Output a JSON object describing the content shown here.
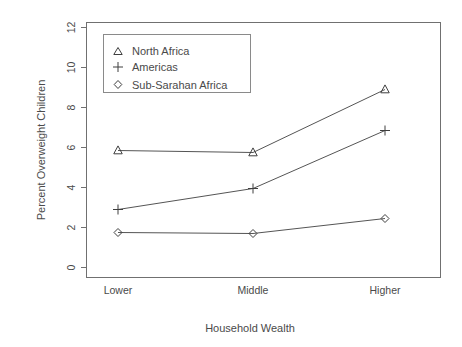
{
  "chart_data": {
    "type": "line",
    "title": "",
    "xlabel": "Household Wealth",
    "ylabel": "Percent Overweight Children",
    "categories": [
      "Lower",
      "Middle",
      "Higher"
    ],
    "series": [
      {
        "name": "North Africa",
        "marker": "triangle",
        "values": [
          5.85,
          5.75,
          8.9
        ]
      },
      {
        "name": "Americas",
        "marker": "plus",
        "values": [
          2.9,
          3.95,
          6.85
        ]
      },
      {
        "name": "Sub-Sarahan Africa",
        "marker": "diamond",
        "values": [
          1.75,
          1.7,
          2.45
        ]
      }
    ],
    "ylim": [
      0,
      12
    ],
    "yticks": [
      0,
      2,
      4,
      6,
      8,
      10,
      12
    ],
    "ytick_labels": [
      "0",
      "2",
      "4",
      "6",
      "8",
      "10",
      "12"
    ],
    "grid": false,
    "legend_position": "top-left",
    "colors": {
      "line": "#555555",
      "marker": "#3f3f3f",
      "axis": "#707070",
      "text": "#4a4a4a",
      "background": "#ffffff"
    }
  },
  "axes": {
    "y_label": "Percent Overweight Children",
    "x_label": "Household Wealth",
    "y_ticks": [
      "0",
      "2",
      "4",
      "6",
      "8",
      "10",
      "12"
    ],
    "x_ticks": [
      "Lower",
      "Middle",
      "Higher"
    ]
  },
  "legend": {
    "entries": [
      {
        "symbol": "triangle-marker",
        "label": "North Africa"
      },
      {
        "symbol": "plus-marker",
        "label": "Americas"
      },
      {
        "symbol": "diamond-marker",
        "label": "Sub-Sarahan Africa"
      }
    ]
  }
}
